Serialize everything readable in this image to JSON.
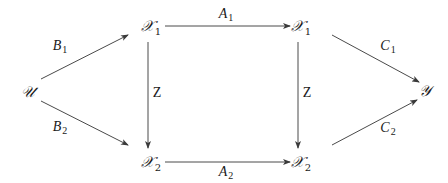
{
  "diagram": {
    "type": "commutative-diagram",
    "colors": {
      "stroke": "#4a4a4a",
      "text": "#1a1a1a",
      "background": "#ffffff"
    },
    "nodes": {
      "U": {
        "symbol": "𝒰",
        "sub": ""
      },
      "X1_left": {
        "symbol": "𝒳",
        "sub": "1"
      },
      "X1_right": {
        "symbol": "𝒳",
        "sub": "1"
      },
      "X2_left": {
        "symbol": "𝒳",
        "sub": "2"
      },
      "X2_right": {
        "symbol": "𝒳",
        "sub": "2"
      },
      "Y": {
        "symbol": "𝒴",
        "sub": ""
      }
    },
    "edges": {
      "B1": {
        "from": "U",
        "to": "X1_left",
        "label": "B",
        "sub": "1"
      },
      "B2": {
        "from": "U",
        "to": "X2_left",
        "label": "B",
        "sub": "2"
      },
      "A1": {
        "from": "X1_left",
        "to": "X1_right",
        "label": "A",
        "sub": "1"
      },
      "A2": {
        "from": "X2_left",
        "to": "X2_right",
        "label": "A",
        "sub": "2"
      },
      "Z_left": {
        "from": "X1_left",
        "to": "X2_left",
        "label": "Z",
        "sub": ""
      },
      "Z_right": {
        "from": "X1_right",
        "to": "X2_right",
        "label": "Z",
        "sub": ""
      },
      "C1": {
        "from": "X1_right",
        "to": "Y",
        "label": "C",
        "sub": "1"
      },
      "C2": {
        "from": "X2_right",
        "to": "Y",
        "label": "C",
        "sub": "2"
      }
    }
  }
}
